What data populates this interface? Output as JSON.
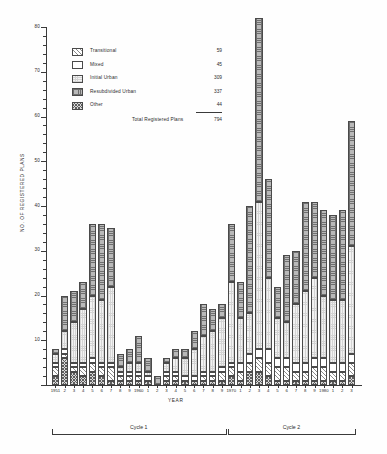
{
  "chart_data": {
    "type": "bar",
    "title": "",
    "xlabel": "YEAR",
    "ylabel": "NO. OF REGISTERED PLANS",
    "ylim": [
      0,
      80
    ],
    "ytick_step": 10,
    "yticks": [
      0,
      10,
      20,
      30,
      40,
      50,
      60,
      70,
      80
    ],
    "ytick_labels": [
      "",
      "10",
      "20",
      "30",
      "40",
      "50",
      "60",
      "70",
      "80"
    ],
    "grid": false,
    "stacked": true,
    "legend_position": "upper-left-inset",
    "categories": [
      "1951",
      "2",
      "3",
      "4",
      "5",
      "6",
      "7",
      "8",
      "9",
      "1960",
      "1",
      "2",
      "3",
      "4",
      "5",
      "6",
      "7",
      "8",
      "9",
      "1970",
      "1",
      "2",
      "3",
      "4",
      "5",
      "6",
      "7",
      "8",
      "9",
      "1980",
      "1",
      "2",
      "3"
    ],
    "series": [
      {
        "name": "Transitional",
        "pattern": "pat-transitional",
        "total": 59,
        "values": [
          2,
          1,
          1,
          2,
          2,
          2,
          3,
          1,
          1,
          1,
          0,
          0,
          1,
          1,
          0,
          0,
          1,
          1,
          2,
          2,
          2,
          2,
          3,
          3,
          3,
          3,
          2,
          2,
          3,
          3,
          2,
          2,
          3
        ]
      },
      {
        "name": "Mixed",
        "pattern": "pat-mixed",
        "total": 45,
        "values": [
          1,
          1,
          1,
          1,
          1,
          1,
          1,
          1,
          1,
          1,
          1,
          0,
          1,
          1,
          1,
          1,
          1,
          1,
          1,
          1,
          2,
          2,
          2,
          3,
          2,
          2,
          2,
          2,
          2,
          2,
          2,
          2,
          2
        ]
      },
      {
        "name": "Initial Urban",
        "pattern": "pat-initial",
        "total": 309,
        "values": [
          2,
          4,
          9,
          12,
          14,
          14,
          17,
          1,
          2,
          2,
          1,
          0,
          2,
          3,
          4,
          6,
          8,
          9,
          11,
          18,
          10,
          9,
          33,
          16,
          9,
          8,
          13,
          16,
          18,
          14,
          14,
          14,
          24
        ]
      },
      {
        "name": "Resubdivided Urban",
        "pattern": "pat-resub",
        "total": 337,
        "values": [
          1,
          8,
          7,
          6,
          16,
          17,
          13,
          3,
          3,
          6,
          3,
          2,
          1,
          2,
          2,
          4,
          7,
          5,
          3,
          13,
          8,
          24,
          41,
          22,
          7,
          15,
          12,
          20,
          17,
          19,
          19,
          20,
          28
        ]
      },
      {
        "name": "Other",
        "pattern": "pat-other",
        "total": 44,
        "values": [
          2,
          6,
          3,
          2,
          3,
          2,
          1,
          1,
          1,
          1,
          1,
          0,
          1,
          1,
          1,
          1,
          1,
          1,
          1,
          2,
          1,
          3,
          3,
          2,
          1,
          1,
          1,
          1,
          1,
          1,
          1,
          1,
          2
        ]
      }
    ],
    "totals": [
      8,
      20,
      21,
      23,
      36,
      36,
      35,
      7,
      8,
      11,
      6,
      2,
      6,
      8,
      8,
      12,
      18,
      17,
      18,
      36,
      23,
      40,
      82,
      46,
      22,
      29,
      30,
      41,
      41,
      39,
      38,
      39,
      59
    ],
    "annotations": {
      "cycle_1": {
        "label": "Cycle 1",
        "start_year": "1951",
        "end_year": "1969"
      },
      "cycle_2": {
        "label": "Cycle 2",
        "start_year": "1970",
        "end_year": "1983"
      }
    }
  },
  "legend": {
    "items": [
      {
        "label": "Transitional",
        "value": "59"
      },
      {
        "label": "Mixed",
        "value": "45"
      },
      {
        "label": "Initial Urban",
        "value": "309"
      },
      {
        "label": "Resubdivided Urban",
        "value": "337"
      },
      {
        "label": "Other",
        "value": "44"
      }
    ],
    "total_label": "Total Registered Plans",
    "total_value": "794"
  },
  "axes": {
    "y_title": "NO. OF REGISTERED PLANS",
    "x_title": "YEAR"
  },
  "cycles": [
    {
      "label": "Cycle 1"
    },
    {
      "label": "Cycle 2"
    }
  ]
}
